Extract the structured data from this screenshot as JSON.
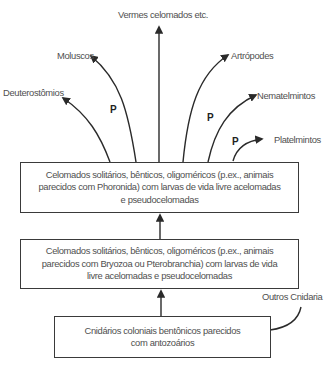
{
  "diagram": {
    "type": "phylogenetic-flow",
    "outcomes": [
      {
        "id": "vermes",
        "label": "Vermes celomados etc."
      },
      {
        "id": "moluscos",
        "label": "Moluscos"
      },
      {
        "id": "artropodes",
        "label": "Artrópodes"
      },
      {
        "id": "deuterostomios",
        "label": "Deuterostômios"
      },
      {
        "id": "nematelmintos",
        "label": "Nematelmintos"
      },
      {
        "id": "platelmintos",
        "label": "Platelmintos"
      }
    ],
    "p_marks": [
      "P",
      "P",
      "P"
    ],
    "boxes": [
      {
        "id": "phoronida-level",
        "lines": [
          "Celomados solitários, bênticos, oligoméricos (p.ex., animais",
          "parecidos com Phoronida) com larvas de vida livre acelomadas",
          "e pseudocelomadas"
        ]
      },
      {
        "id": "bryozoa-level",
        "lines": [
          "Celomados solitários, bênticos, oligoméricos (p.ex., animais",
          "parecidos com Bryozoa ou Pterobranchia) com larvas de vida",
          "livre acelomadas e pseudocelomadas"
        ]
      },
      {
        "id": "cnidaria-level",
        "lines": [
          "Cnidários coloniais bentônicos parecidos",
          "com antozoários"
        ]
      }
    ],
    "side_branch": {
      "label": "Outros Cnidaria"
    },
    "colors": {
      "line": "#2a2a2a",
      "text": "#505050",
      "box_border": "#3a3a3a"
    }
  }
}
